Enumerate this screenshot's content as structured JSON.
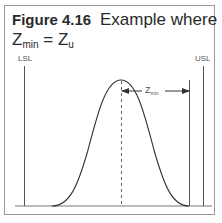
{
  "figure": {
    "number_label": "Figure 4.16",
    "title_text": "Example where",
    "equation_left_base": "Z",
    "equation_left_sub": "min",
    "equation_op": " = ",
    "equation_right_base": "Z",
    "equation_right_sub": "u"
  },
  "diagram": {
    "lsl_label": "LSL",
    "usl_label": "USL",
    "zmin_label_base": "Z",
    "zmin_label_sub": "min",
    "line_color": "#333333",
    "frame_color": "#9a9a9a"
  }
}
